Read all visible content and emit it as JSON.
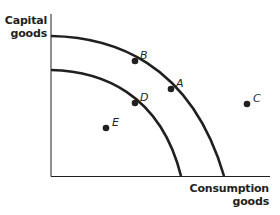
{
  "diagram": {
    "type": "production-possibility-frontier",
    "colors": {
      "ink": "#231f20",
      "background": "#ffffff"
    },
    "axes": {
      "y_label": [
        "Capital",
        "goods"
      ],
      "x_label": [
        "Consumption",
        "goods"
      ]
    },
    "curves": [
      {
        "id": "outer-ppf",
        "label": "outer frontier"
      },
      {
        "id": "inner-ppf",
        "label": "inner frontier"
      }
    ],
    "points": [
      {
        "id": "A",
        "label": "A",
        "location": "on outer frontier"
      },
      {
        "id": "B",
        "label": "B",
        "location": "on outer frontier"
      },
      {
        "id": "C",
        "label": "C",
        "location": "outside both frontiers"
      },
      {
        "id": "D",
        "label": "D",
        "location": "on inner frontier"
      },
      {
        "id": "E",
        "label": "E",
        "location": "inside inner frontier"
      }
    ]
  }
}
